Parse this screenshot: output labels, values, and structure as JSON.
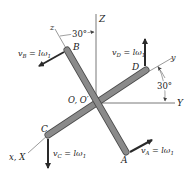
{
  "figure": {
    "type": "rigid-body kinematics diagram",
    "colors": {
      "background": "#ffffff",
      "rod_fill": "#8a8a8a",
      "rod_edge": "#4a4a4a",
      "axis_line": "#555555",
      "arrow": "#2a2a2a",
      "text": "#222222"
    },
    "axes": {
      "Z": "Z",
      "Y": "Y",
      "X": "x, X",
      "z": "z",
      "y": "y"
    },
    "origin_label": "O, O′",
    "points": {
      "A": "A",
      "B": "B",
      "C": "C",
      "D": "D"
    },
    "angles": {
      "top": "30°",
      "right": "30°"
    },
    "velocities": {
      "vB": {
        "sym": "v",
        "sub": "B",
        "eq": " = lω",
        "esub": "1"
      },
      "vD": {
        "sym": "v",
        "sub": "D",
        "eq": " = lω",
        "esub": "1"
      },
      "vC": {
        "sym": "v",
        "sub": "C",
        "eq": " = lω",
        "esub": "1"
      },
      "vA": {
        "sym": "v",
        "sub": "A",
        "eq": " = lω",
        "esub": "1"
      }
    }
  }
}
